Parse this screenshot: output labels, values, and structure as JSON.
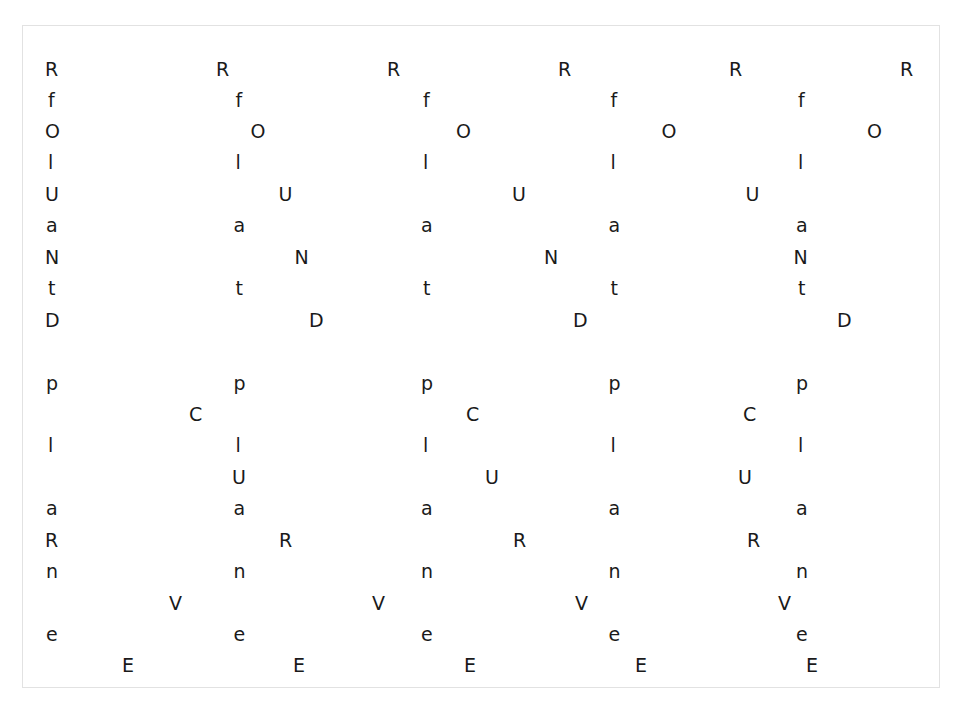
{
  "canvas": {
    "width": 963,
    "height": 723,
    "background": "#ffffff",
    "border_color": "#e2e2e2",
    "text_color": "#1a1a1a",
    "frame": {
      "left": 22,
      "top": 25,
      "width": 918,
      "height": 663
    }
  },
  "typography": {
    "font_size_px": 19,
    "row_spacing_px": 31.2
  },
  "pattern": {
    "description": "Repeating letters arranged in horizontal rows; each row repeats one character at a fixed horizontal period with a row-specific start offset.",
    "vertical_strings": [
      "RfOlUaNtD",
      "plaRne",
      "CUVE"
    ]
  },
  "rows": [
    {
      "index": 0,
      "char": "R",
      "y": 59,
      "x_start": 44,
      "step": 171.0,
      "count": 6
    },
    {
      "index": 1,
      "char": "f",
      "y": 90,
      "x_start": 47,
      "step": 187.5,
      "count": 5
    },
    {
      "index": 2,
      "char": "O",
      "y": 121,
      "x_start": 44,
      "step": 205.5,
      "count": 5
    },
    {
      "index": 3,
      "char": "l",
      "y": 152,
      "x_start": 47,
      "step": 187.5,
      "count": 5
    },
    {
      "index": 4,
      "char": "U",
      "y": 184,
      "x_start": 44,
      "step": 233.5,
      "count": 4
    },
    {
      "index": 5,
      "char": "a",
      "y": 215,
      "x_start": 45,
      "step": 187.5,
      "count": 5
    },
    {
      "index": 6,
      "char": "N",
      "y": 247,
      "x_start": 44,
      "step": 249.5,
      "count": 4
    },
    {
      "index": 7,
      "char": "t",
      "y": 278,
      "x_start": 47,
      "step": 187.5,
      "count": 5
    },
    {
      "index": 8,
      "char": "D",
      "y": 310,
      "x_start": 44,
      "step": 264.0,
      "count": 4
    },
    {
      "index": 9,
      "char": "p",
      "y": 373,
      "x_start": 45,
      "step": 187.5,
      "count": 5
    },
    {
      "index": 10,
      "char": "C",
      "y": 404,
      "x_start": 188,
      "step": 277.0,
      "count": 3
    },
    {
      "index": 11,
      "char": "l",
      "y": 435,
      "x_start": 47,
      "step": 187.5,
      "count": 5
    },
    {
      "index": 12,
      "char": "U",
      "y": 467,
      "x_start": 231,
      "step": 253.0,
      "count": 3
    },
    {
      "index": 13,
      "char": "a",
      "y": 498,
      "x_start": 45,
      "step": 187.5,
      "count": 5
    },
    {
      "index": 14,
      "char": "R",
      "y": 530,
      "x_start": 44,
      "step": 234.0,
      "count": 4
    },
    {
      "index": 15,
      "char": "n",
      "y": 561,
      "x_start": 45,
      "step": 187.5,
      "count": 5
    },
    {
      "index": 16,
      "char": "V",
      "y": 593,
      "x_start": 168,
      "step": 203.0,
      "count": 4
    },
    {
      "index": 17,
      "char": "e",
      "y": 624,
      "x_start": 45,
      "step": 187.5,
      "count": 5
    },
    {
      "index": 18,
      "char": "E",
      "y": 655,
      "x_start": 121,
      "step": 171.0,
      "count": 5
    }
  ]
}
